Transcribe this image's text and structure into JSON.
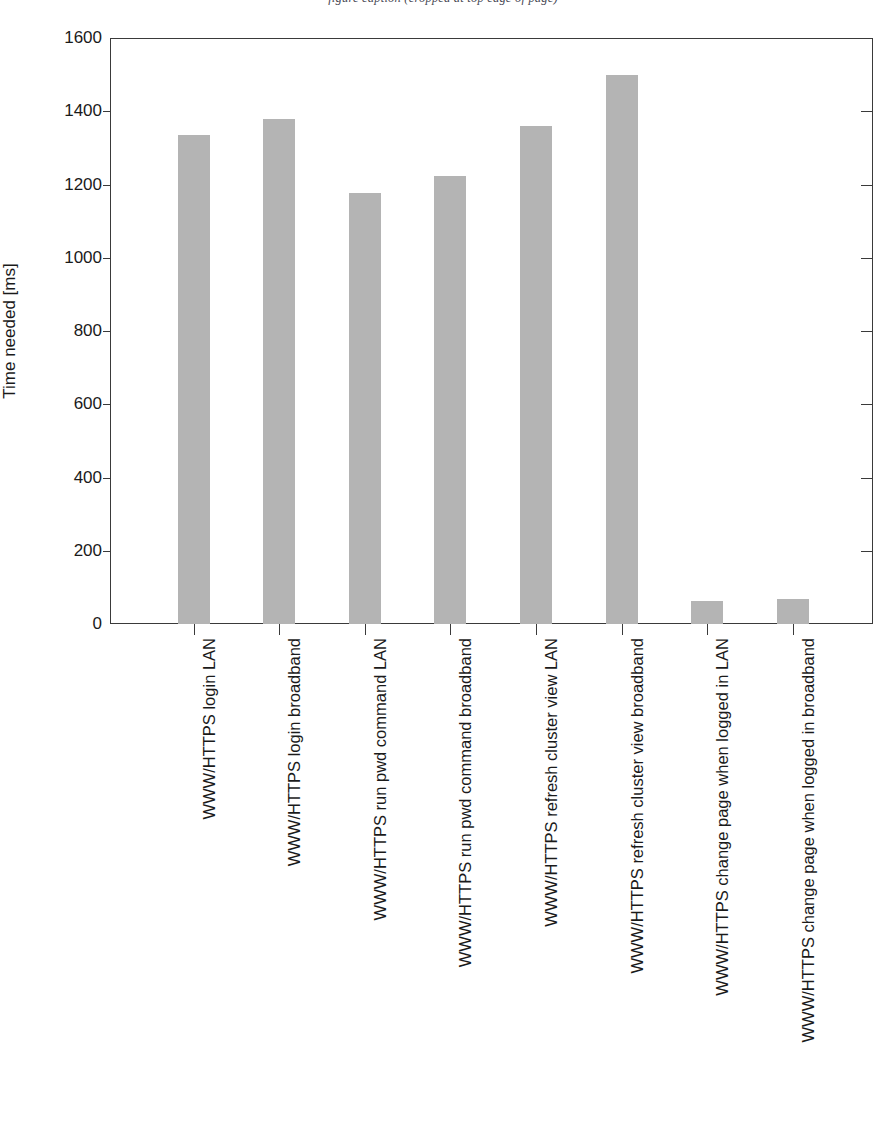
{
  "figure": {
    "cropped_caption_sliver": "figure caption (cropped at top edge of page)"
  },
  "chart_data": {
    "type": "bar",
    "title": "",
    "xlabel": "",
    "ylabel": "Time needed [ms]",
    "ylim": [
      0,
      1600
    ],
    "ytick_values": [
      0,
      200,
      400,
      600,
      800,
      1000,
      1200,
      1400,
      1600
    ],
    "ytick_labels": [
      "0",
      "200",
      "400",
      "600",
      "800",
      "1000",
      "1200",
      "1400",
      "1600"
    ],
    "grid": false,
    "legend": null,
    "bar_color": "#b4b4b4",
    "axis_color": "#3a3a3a",
    "categories": [
      "WWW/HTTPS login LAN",
      "WWW/HTTPS login broadband",
      "WWW/HTTPS run pwd command LAN",
      "WWW/HTTPS run pwd command broadband",
      "WWW/HTTPS refresh cluster view LAN",
      "WWW/HTTPS refresh cluster view broadband",
      "WWW/HTTPS change page when logged in LAN",
      "WWW/HTTPS change page when logged in broadband"
    ],
    "values": [
      1335,
      1380,
      1178,
      1222,
      1360,
      1500,
      64,
      67
    ]
  }
}
